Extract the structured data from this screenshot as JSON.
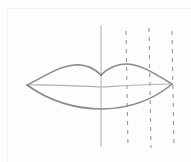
{
  "image": {
    "subject": "Pencil sketch of lips with construction guide lines",
    "colors": {
      "background": "#fdfdfd",
      "lip_outline": "#8a8a8a",
      "lip_center_line": "#b0b0b0",
      "guide_line": "#9a9a9a"
    },
    "guides": {
      "center_line_x": 101,
      "dashed_lines_x": [
        126,
        149,
        172
      ],
      "top_y": 25,
      "bottom_y": 148
    },
    "lips": {
      "left_corner": [
        27,
        85
      ],
      "right_corner": [
        172,
        84
      ],
      "upper_peak_left": [
        75,
        65
      ],
      "cupid_bow_dip": [
        101,
        75
      ],
      "upper_peak_right": [
        126,
        64
      ],
      "center_line_y": 86,
      "lower_lip_bottom": [
        103,
        109
      ]
    }
  }
}
